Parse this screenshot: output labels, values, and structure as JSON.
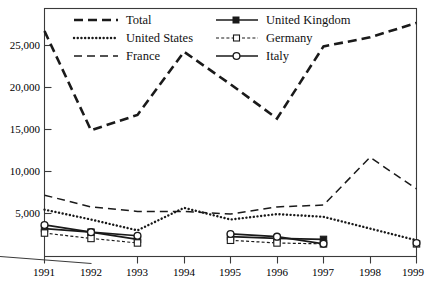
{
  "chart_data": {
    "type": "line",
    "title": "",
    "xlabel": "",
    "ylabel": "",
    "grid": false,
    "legend_position": "top-inside",
    "x": [
      1991,
      1992,
      1993,
      1994,
      1995,
      1996,
      1997,
      1998,
      1999
    ],
    "xticklabels": [
      "1991",
      "1992",
      "1993",
      "1994",
      "1995",
      "1996",
      "1997",
      "1998",
      "1999"
    ],
    "yticks": [
      5000,
      10000,
      15000,
      20000,
      25000
    ],
    "yticklabels": [
      "5,000",
      "10,000",
      "15,000",
      "20,000",
      "25,000"
    ],
    "ylim": [
      0,
      27500
    ],
    "xlim": [
      1991,
      1999
    ],
    "series": [
      {
        "name": "Total",
        "style": "dashed-thick",
        "marker": "none",
        "values": [
          25000,
          14000,
          15700,
          22700,
          19100,
          15300,
          23300,
          24300,
          25900
        ]
      },
      {
        "name": "United States",
        "style": "dotted",
        "marker": "none",
        "values": [
          5200,
          4100,
          2900,
          5400,
          4100,
          4700,
          4400,
          3100,
          1800
        ]
      },
      {
        "name": "France",
        "style": "dashed-thin",
        "marker": "none",
        "values": [
          6800,
          5500,
          5000,
          5000,
          4700,
          5500,
          5700,
          11000,
          7500
        ]
      },
      {
        "name": "United Kingdom",
        "style": "solid",
        "marker": "square-filled",
        "values": [
          3100,
          2700,
          1900,
          null,
          2200,
          2000,
          1900,
          null,
          null
        ]
      },
      {
        "name": "Germany",
        "style": "dashed-dotted",
        "marker": "square-open",
        "values": [
          2600,
          2000,
          1500,
          null,
          1800,
          1500,
          1400,
          null,
          1400
        ]
      },
      {
        "name": "Italy",
        "style": "solid",
        "marker": "circle-open",
        "values": [
          3500,
          2700,
          2300,
          null,
          2500,
          2200,
          1400,
          null,
          1500
        ]
      }
    ]
  },
  "legend": {
    "entries": [
      {
        "label": "Total",
        "key": "total"
      },
      {
        "label": "United States",
        "key": "united-states"
      },
      {
        "label": "France",
        "key": "france"
      },
      {
        "label": "United Kingdom",
        "key": "united-kingdom"
      },
      {
        "label": "Germany",
        "key": "germany"
      },
      {
        "label": "Italy",
        "key": "italy"
      }
    ]
  },
  "colors": {
    "line": "#1a1a1a",
    "frame": "#3a3a3a",
    "background": "#ffffff"
  }
}
